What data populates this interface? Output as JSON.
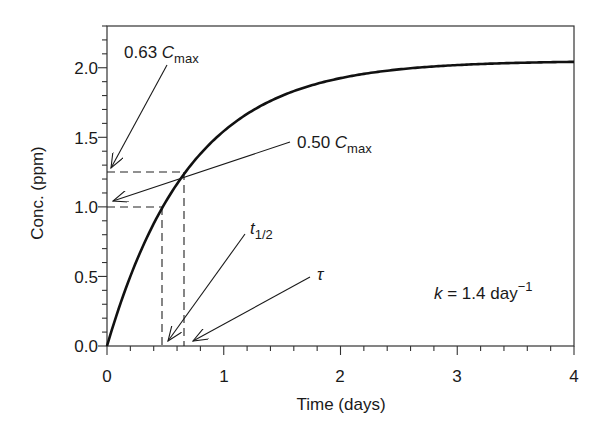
{
  "chart_data": {
    "type": "line",
    "title": "",
    "xlabel": "Time (days)",
    "ylabel": "Conc. (ppm)",
    "xlim": [
      0,
      4
    ],
    "ylim": [
      0,
      2.3
    ],
    "grid": false,
    "legend": null,
    "x_ticks": [
      "0",
      "1",
      "2",
      "3",
      "4"
    ],
    "x_tick_values": [
      0,
      1,
      2,
      3,
      4
    ],
    "y_ticks": [
      "0.0",
      "0.5",
      "1.0",
      "1.5",
      "2.0"
    ],
    "y_tick_values": [
      0.0,
      0.5,
      1.0,
      1.5,
      2.0
    ],
    "series": [
      {
        "name": "C(t) = Cmax(1 - e^(-kt))",
        "Cmax": 2.05,
        "k": 1.4,
        "x": [
          0,
          0.25,
          0.5,
          0.75,
          1.0,
          1.25,
          1.5,
          1.75,
          2.0,
          2.5,
          3.0,
          3.5,
          4.0
        ],
        "values": [
          0,
          0.61,
          1.03,
          1.33,
          1.54,
          1.69,
          1.79,
          1.87,
          1.93,
          2.01,
          2.04,
          2.04,
          2.05
        ]
      }
    ],
    "reference_lines": [
      {
        "type": "horizontal-dashed",
        "y": 1.25,
        "x_range": [
          0,
          0.66
        ],
        "meaning": "0.63 Cmax"
      },
      {
        "type": "horizontal-dashed",
        "y": 1.0,
        "x_range": [
          0,
          0.47
        ],
        "meaning": "0.50 Cmax"
      },
      {
        "type": "vertical-dashed",
        "x": 0.47,
        "y_range": [
          0,
          1.0
        ],
        "meaning": "t1/2"
      },
      {
        "type": "vertical-dashed",
        "x": 0.66,
        "y_range": [
          0,
          1.25
        ],
        "meaning": "tau"
      }
    ],
    "annotations": [
      {
        "text": "0.63 Cmax",
        "main": "0.63 ",
        "italic": "C",
        "sub": "max",
        "points_to": [
          0,
          1.25
        ]
      },
      {
        "text": "0.50 Cmax",
        "main": "0.50 ",
        "italic": "C",
        "sub": "max",
        "points_to": [
          0,
          1.0
        ]
      },
      {
        "text": "t1/2",
        "italic": "t",
        "sub": "1/2",
        "points_to": [
          0.5,
          0
        ]
      },
      {
        "text": "τ",
        "italic": "τ",
        "points_to": [
          0.73,
          0
        ]
      },
      {
        "text": "k = 1.4 day-1",
        "italic": "k",
        "main": " = 1.4 day",
        "sup": "−1"
      }
    ]
  }
}
